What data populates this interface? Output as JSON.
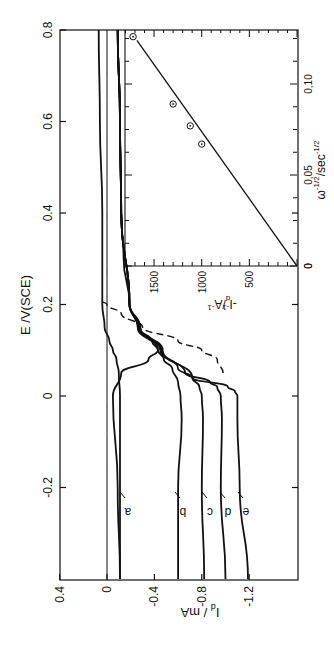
{
  "chart_data": [
    {
      "type": "line",
      "title": "",
      "orientation_note": "figure rotated 90 degrees counterclockwise on page",
      "xlabel": "E / V (SCE)",
      "ylabel": "I_d / mA",
      "xlim": [
        -0.4,
        0.8
      ],
      "ylim": [
        -1.45,
        0.4
      ],
      "xticks": [
        -0.2,
        0,
        0.2,
        0.4,
        0.6,
        0.8
      ],
      "xtick_labels": [
        "-0.2",
        "0",
        "0.2",
        "0.4",
        "0.6",
        "0.8"
      ],
      "yticks": [
        0.4,
        0,
        -0.4,
        -0.8,
        -1.2
      ],
      "ytick_labels": [
        "0.4",
        "0",
        "-0.4",
        "-0.8",
        "-1.2"
      ],
      "grid": false,
      "annotations": [
        "a",
        "b",
        "c",
        "d",
        "e"
      ],
      "series": [
        {
          "name": "baseline",
          "style": "thin",
          "x": [
            -0.4,
            0.8
          ],
          "y": [
            0.0,
            0.0
          ]
        },
        {
          "name": "a",
          "style": "solid",
          "x": [
            -0.4,
            -0.2,
            0.0,
            0.05,
            0.08,
            0.1,
            0.12,
            0.15,
            0.2,
            0.3,
            0.4,
            0.6,
            0.8
          ],
          "y": [
            -0.11,
            -0.09,
            -0.05,
            -0.12,
            -0.35,
            -0.43,
            -0.38,
            -0.26,
            -0.19,
            -0.14,
            -0.12,
            -0.11,
            -0.09
          ]
        },
        {
          "name": "a-reverse",
          "style": "solid",
          "x": [
            -0.4,
            -0.2,
            0.0,
            0.05,
            0.08,
            0.1,
            0.12,
            0.15,
            0.2,
            0.3,
            0.4,
            0.6,
            0.8
          ],
          "y": [
            -0.11,
            -0.11,
            -0.11,
            -0.1,
            -0.08,
            -0.05,
            -0.02,
            0.02,
            0.04,
            0.04,
            0.04,
            0.06,
            0.07
          ]
        },
        {
          "name": "b",
          "style": "solid",
          "x": [
            -0.4,
            -0.2,
            -0.05,
            0.0,
            0.03,
            0.06,
            0.08,
            0.1,
            0.15,
            0.2,
            0.4,
            0.6,
            0.8
          ],
          "y": [
            -0.6,
            -0.6,
            -0.63,
            -0.62,
            -0.6,
            -0.55,
            -0.48,
            -0.43,
            -0.26,
            -0.19,
            -0.12,
            -0.11,
            -0.09
          ]
        },
        {
          "name": "c",
          "style": "solid",
          "x": [
            -0.4,
            -0.2,
            -0.05,
            0.0,
            0.02,
            0.04,
            0.06,
            0.1,
            0.15,
            0.2,
            0.4,
            0.6,
            0.8
          ],
          "y": [
            -0.82,
            -0.8,
            -0.81,
            -0.8,
            -0.78,
            -0.72,
            -0.6,
            -0.45,
            -0.27,
            -0.19,
            -0.12,
            -0.11,
            -0.09
          ]
        },
        {
          "name": "d",
          "style": "solid",
          "x": [
            -0.4,
            -0.2,
            -0.05,
            0.0,
            0.02,
            0.03,
            0.05,
            0.1,
            0.15,
            0.2,
            0.4,
            0.6,
            0.8
          ],
          "y": [
            -1.0,
            -0.96,
            -0.97,
            -0.96,
            -0.93,
            -0.87,
            -0.66,
            -0.46,
            -0.28,
            -0.19,
            -0.12,
            -0.11,
            -0.09
          ]
        },
        {
          "name": "e",
          "style": "solid",
          "x": [
            -0.4,
            -0.2,
            -0.05,
            0.0,
            0.01,
            0.02,
            0.04,
            0.1,
            0.15,
            0.2,
            0.4,
            0.6,
            0.8
          ],
          "y": [
            -1.19,
            -1.12,
            -1.1,
            -1.1,
            -1.08,
            -1.02,
            -0.72,
            -0.47,
            -0.28,
            -0.19,
            -0.12,
            -0.11,
            -0.09
          ]
        },
        {
          "name": "dashed",
          "style": "dashed",
          "x": [
            0.05,
            0.08,
            0.1,
            0.12,
            0.15,
            0.18,
            0.2,
            0.21
          ],
          "y": [
            -0.98,
            -0.93,
            -0.8,
            -0.6,
            -0.3,
            -0.12,
            0.0,
            0.07
          ]
        }
      ]
    },
    {
      "type": "scatter",
      "title": "inset",
      "xlabel": "ω^-1/2 / sec^-1/2",
      "ylabel": "-I_d^-1 / A^-1",
      "xlim": [
        0,
        0.13
      ],
      "ylim": [
        0,
        1800
      ],
      "xticks": [
        0,
        0.05,
        0.1
      ],
      "xtick_labels": [
        "0",
        "0,05",
        "0,10"
      ],
      "yticks": [
        0,
        500,
        1000,
        1500
      ],
      "ytick_labels": [
        "0",
        "500",
        "1000",
        "1500"
      ],
      "grid": false,
      "points": {
        "x": [
          0.067,
          0.077,
          0.089,
          0.126
        ],
        "y": [
          1000,
          1120,
          1300,
          1720
        ]
      },
      "fit_line": {
        "x": [
          0,
          0.124
        ],
        "y": [
          0,
          1680
        ]
      }
    }
  ],
  "labels": {
    "e_axis_title": "E /V(SCE)",
    "i_axis_title": "I",
    "i_axis_sub": "d",
    "i_axis_unit": " / mA",
    "inset_x_title": "ω",
    "inset_x_sup": "-1/2",
    "inset_x_unit": "/sec",
    "inset_x_unit_sup": "-1/2",
    "inset_y_title": "-I",
    "inset_y_sub": "d",
    "inset_y_sup": "-1",
    "inset_y_unit": "/A",
    "inset_y_unit_sup": "-1"
  },
  "colors": {
    "ink": "#111111",
    "background": "#ffffff"
  }
}
